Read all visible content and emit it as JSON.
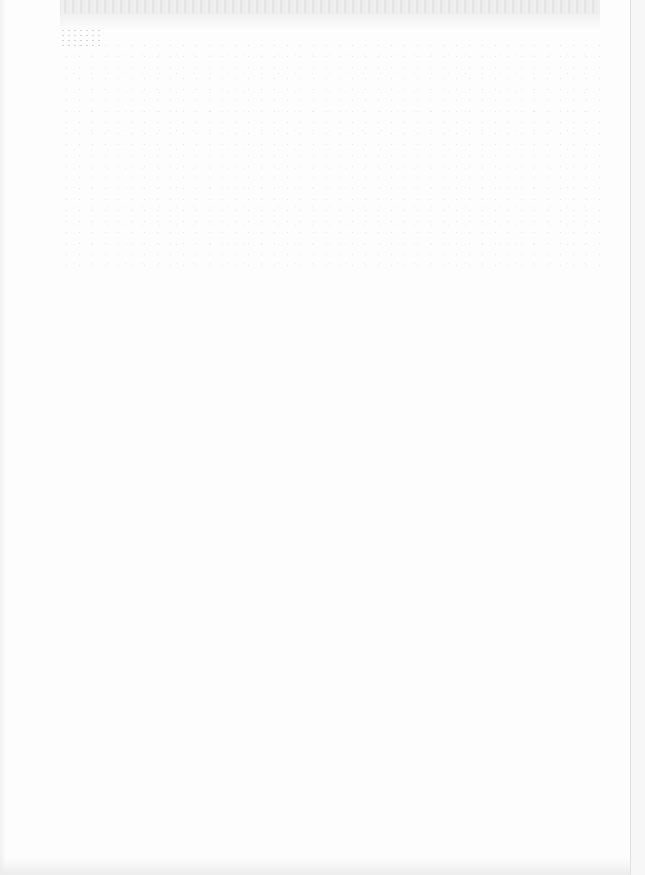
{
  "document": {
    "type": "scanned-page",
    "legible_text": [],
    "colors": {
      "paper": "#fdfdfd",
      "scan_noise": "#d6d6d6",
      "fold_line": "#e2e2e2"
    }
  }
}
